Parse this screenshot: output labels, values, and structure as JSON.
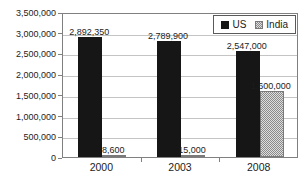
{
  "chart_data": {
    "type": "bar",
    "title": "",
    "categories": [
      "2000",
      "2003",
      "2008"
    ],
    "series": [
      {
        "name": "US",
        "values": [
          2892350,
          2789900,
          2547000
        ],
        "data_labels": [
          "2,892,350",
          "2,789,900",
          "2,547,000"
        ],
        "style": "solid-black"
      },
      {
        "name": "India",
        "values": [
          8600,
          15000,
          1600000
        ],
        "data_labels": [
          "8,600",
          "15,000",
          "1,600,000"
        ],
        "style": "gray-dotted"
      }
    ],
    "xlabel": "",
    "ylabel": "",
    "ylim": [
      0,
      3500000
    ],
    "ytick_interval": 500000,
    "ytick_labels": [
      "0",
      "500,000",
      "1,000,000",
      "1,500,000",
      "2,000,000",
      "2,500,000",
      "3,000,000",
      "3,500,000"
    ],
    "grid": "horizontal",
    "legend_position": "top-right-inside"
  },
  "colors": {
    "us_bar": "#161616",
    "india_bar_bg": "#dedede",
    "india_bar_dot": "#8a8a8a",
    "gridline": "#c4c4c4",
    "plot_border": "#808080",
    "text": "#1c1c1c",
    "background": "#ffffff"
  }
}
